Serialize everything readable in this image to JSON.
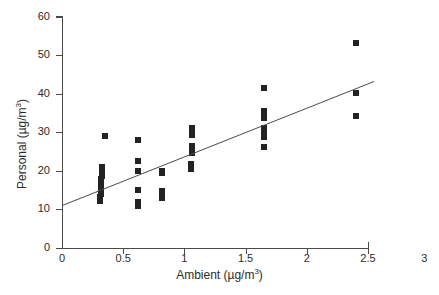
{
  "chart_data": {
    "type": "scatter",
    "title": "",
    "xlabel": "Ambient (µg/m³)",
    "ylabel": "Personal (µg/m³)",
    "xlabel_base": "Ambient (µg/m",
    "xlabel_sup": "3",
    "xlabel_tail": ")",
    "ylabel_base": "Personal (µg/m",
    "ylabel_sup": "3",
    "ylabel_tail": ")",
    "xlim": [
      0,
      2.7
    ],
    "ylim": [
      0,
      60
    ],
    "xticks": [
      0,
      0.5,
      1,
      1.5,
      2,
      2.5
    ],
    "xtick_labels": [
      "0",
      "0.5",
      "1",
      "1.5",
      "2",
      "2.5"
    ],
    "extra_x_label": "3",
    "yticks": [
      0,
      10,
      20,
      30,
      40,
      50,
      60
    ],
    "ytick_labels": [
      "0",
      "10",
      "20",
      "30",
      "40",
      "50",
      "60"
    ],
    "grid": false,
    "legend": null,
    "marker": {
      "shape": "square",
      "color": "#232323",
      "size_px": 6
    },
    "points": [
      {
        "x": 0.31,
        "y": 12.2
      },
      {
        "x": 0.31,
        "y": 13.2
      },
      {
        "x": 0.32,
        "y": 14.0
      },
      {
        "x": 0.32,
        "y": 14.9
      },
      {
        "x": 0.32,
        "y": 15.6
      },
      {
        "x": 0.32,
        "y": 16.3
      },
      {
        "x": 0.32,
        "y": 17.0
      },
      {
        "x": 0.32,
        "y": 17.8
      },
      {
        "x": 0.33,
        "y": 18.6
      },
      {
        "x": 0.33,
        "y": 19.4
      },
      {
        "x": 0.33,
        "y": 20.2
      },
      {
        "x": 0.33,
        "y": 20.9
      },
      {
        "x": 0.35,
        "y": 29.1
      },
      {
        "x": 0.62,
        "y": 11.0
      },
      {
        "x": 0.62,
        "y": 12.0
      },
      {
        "x": 0.62,
        "y": 15.0
      },
      {
        "x": 0.62,
        "y": 20.1
      },
      {
        "x": 0.62,
        "y": 22.6
      },
      {
        "x": 0.62,
        "y": 28.0
      },
      {
        "x": 0.82,
        "y": 13.0
      },
      {
        "x": 0.82,
        "y": 14.0
      },
      {
        "x": 0.82,
        "y": 14.8
      },
      {
        "x": 0.82,
        "y": 19.4
      },
      {
        "x": 0.82,
        "y": 20.0
      },
      {
        "x": 1.05,
        "y": 20.6
      },
      {
        "x": 1.05,
        "y": 21.7
      },
      {
        "x": 1.06,
        "y": 24.6
      },
      {
        "x": 1.06,
        "y": 25.6
      },
      {
        "x": 1.06,
        "y": 26.4
      },
      {
        "x": 1.06,
        "y": 29.4
      },
      {
        "x": 1.06,
        "y": 30.4
      },
      {
        "x": 1.06,
        "y": 31.0
      },
      {
        "x": 1.65,
        "y": 26.2
      },
      {
        "x": 1.65,
        "y": 28.9
      },
      {
        "x": 1.65,
        "y": 30.0
      },
      {
        "x": 1.65,
        "y": 31.0
      },
      {
        "x": 1.65,
        "y": 33.6
      },
      {
        "x": 1.65,
        "y": 34.6
      },
      {
        "x": 1.65,
        "y": 35.6
      },
      {
        "x": 1.65,
        "y": 41.6
      },
      {
        "x": 2.4,
        "y": 34.2
      },
      {
        "x": 2.4,
        "y": 40.2
      },
      {
        "x": 2.4,
        "y": 53.1
      }
    ],
    "fit_line": {
      "type": "linear-regression",
      "x_start": 0.0,
      "y_start": 11.0,
      "x_end": 2.55,
      "y_end": 43.2,
      "color": "#4a4a4a"
    }
  }
}
